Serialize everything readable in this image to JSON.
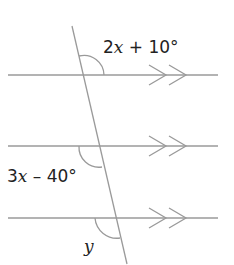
{
  "diagram": {
    "type": "parallel-lines-transversal",
    "parallel_lines": 3,
    "labels": {
      "top_angle": {
        "coef": "2",
        "var": "x",
        "rest": " + 10°"
      },
      "middle_angle": {
        "coef": "3",
        "var": "x",
        "rest": " – 40°"
      },
      "bottom_angle": {
        "var": "y"
      }
    },
    "colors": {
      "line": "#9a9a9a",
      "text": "#222222"
    }
  }
}
